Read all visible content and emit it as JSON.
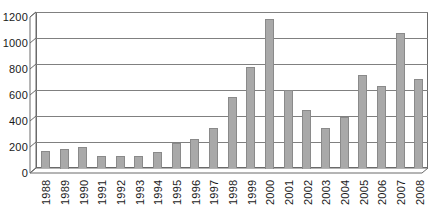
{
  "chart_data": {
    "type": "bar",
    "title": "",
    "subtitle": "",
    "xlabel": "",
    "ylabel": "",
    "categories": [
      "1988",
      "1989",
      "1990",
      "1991",
      "1992",
      "1993",
      "1994",
      "1995",
      "1996",
      "1997",
      "1998",
      "1999",
      "2000",
      "2001",
      "2002",
      "2003",
      "2004",
      "2005",
      "2006",
      "2007",
      "2008"
    ],
    "values": [
      130,
      150,
      160,
      95,
      90,
      95,
      125,
      190,
      225,
      305,
      545,
      780,
      1150,
      600,
      450,
      310,
      390,
      715,
      630,
      1040,
      685
    ],
    "series": [
      {
        "name": "",
        "values": [
          130,
          150,
          160,
          95,
          90,
          95,
          125,
          190,
          225,
          305,
          545,
          780,
          1150,
          600,
          450,
          310,
          390,
          715,
          630,
          1040,
          685
        ]
      }
    ],
    "ylim": [
      0,
      1200
    ],
    "ytick_labels": [
      "0",
      "200",
      "400",
      "600",
      "800",
      "1000",
      "1200"
    ],
    "ytick_values": [
      0,
      200,
      400,
      600,
      800,
      1000,
      1200
    ],
    "grid": true,
    "legend": false,
    "legend_position": "none",
    "bar_color": "#a9a9a9",
    "bar_edge_color": "#8a8a8a",
    "gridline_color": "#808080",
    "axis_color": "#6a6a6a",
    "text_color": "#1a1a1a",
    "background_color": "#ffffff"
  }
}
